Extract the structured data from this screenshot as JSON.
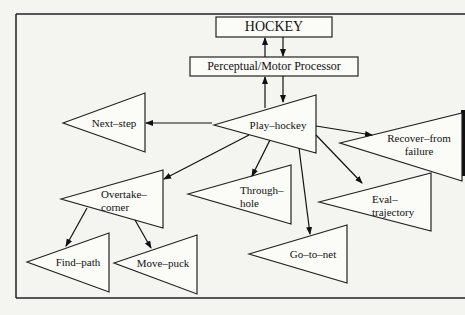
{
  "diagram": {
    "frame": {
      "stroke": "#222222"
    },
    "boxes": [
      {
        "id": "hockey",
        "label": "HOCKEY"
      },
      {
        "id": "pmp",
        "label": "Perceptual/Motor Processor"
      }
    ],
    "nodes": [
      {
        "id": "play-hockey",
        "label": "Play–hockey"
      },
      {
        "id": "next-step",
        "label": "Next–step"
      },
      {
        "id": "recover",
        "label_line1": "Recover–from",
        "label_line2": "failure"
      },
      {
        "id": "overtake",
        "label_line1": "Overtake–",
        "label_line2": "corner"
      },
      {
        "id": "through-hole",
        "label_line1": "Through–",
        "label_line2": "hole"
      },
      {
        "id": "eval",
        "label_line1": "Eval–",
        "label_line2": "trajectory"
      },
      {
        "id": "go-to-net",
        "label": "Go–to–net"
      },
      {
        "id": "find-path",
        "label": "Find–path"
      },
      {
        "id": "move-puck",
        "label": "Move–puck"
      }
    ],
    "edges": [
      {
        "from": "pmp",
        "to": "hockey"
      },
      {
        "from": "hockey",
        "to": "pmp"
      },
      {
        "from": "play-hockey",
        "to": "pmp"
      },
      {
        "from": "pmp",
        "to": "play-hockey"
      },
      {
        "from": "play-hockey",
        "to": "next-step"
      },
      {
        "from": "play-hockey",
        "to": "recover"
      },
      {
        "from": "play-hockey",
        "to": "overtake"
      },
      {
        "from": "play-hockey",
        "to": "through-hole"
      },
      {
        "from": "play-hockey",
        "to": "eval"
      },
      {
        "from": "play-hockey",
        "to": "go-to-net"
      },
      {
        "from": "overtake",
        "to": "find-path"
      },
      {
        "from": "overtake",
        "to": "move-puck"
      }
    ]
  }
}
